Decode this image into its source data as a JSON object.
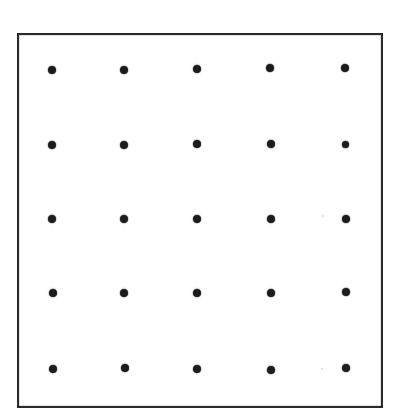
{
  "figure": {
    "canvas": {
      "width": 401,
      "height": 419,
      "background": "#ffffff"
    },
    "frame": {
      "x": 17,
      "y": 33,
      "width": 366,
      "height": 375,
      "border_width": 2,
      "border_color": "#2b2b2b",
      "fill": "#ffffff"
    },
    "marker": {
      "shape": "circle",
      "diameter": 8,
      "color": "#1c1c1c",
      "count": 25
    },
    "artifacts": [
      {
        "name": "faint-speck",
        "x": 323,
        "y": 216,
        "size": 2
      },
      {
        "name": "faint-speck",
        "x": 322,
        "y": 369,
        "size": 2
      }
    ]
  },
  "chart_data": {
    "type": "scatter",
    "title": "",
    "subtitle": "",
    "xlabel": "",
    "ylabel": "",
    "grid": false,
    "legend": null,
    "xlim": [
      0,
      6
    ],
    "ylim": [
      0,
      6
    ],
    "rows": 5,
    "columns": 5,
    "row_labels": [
      "1",
      "2",
      "3",
      "4",
      "5"
    ],
    "column_labels": [
      "1",
      "2",
      "3",
      "4",
      "5"
    ],
    "marker_color": "#1c1c1c",
    "marker_size": 8,
    "x": [
      1,
      2,
      3,
      4,
      5,
      1,
      2,
      3,
      4,
      5,
      1,
      2,
      3,
      4,
      5,
      1,
      2,
      3,
      4,
      5,
      1,
      2,
      3,
      4,
      5
    ],
    "y": [
      5,
      5,
      5,
      5,
      5,
      4,
      4,
      4,
      4,
      4,
      3,
      3,
      3,
      3,
      3,
      2,
      2,
      2,
      2,
      2,
      1,
      1,
      1,
      1,
      1
    ],
    "points": [
      {
        "row": 1,
        "col": 1,
        "px": 52,
        "py": 70,
        "d": 8
      },
      {
        "row": 1,
        "col": 2,
        "px": 124,
        "py": 70,
        "d": 8
      },
      {
        "row": 1,
        "col": 3,
        "px": 197,
        "py": 69,
        "d": 8
      },
      {
        "row": 1,
        "col": 4,
        "px": 270,
        "py": 68,
        "d": 8
      },
      {
        "row": 1,
        "col": 5,
        "px": 345,
        "py": 68,
        "d": 8
      },
      {
        "row": 2,
        "col": 1,
        "px": 52,
        "py": 145,
        "d": 8
      },
      {
        "row": 2,
        "col": 2,
        "px": 124,
        "py": 145,
        "d": 8
      },
      {
        "row": 2,
        "col": 3,
        "px": 197,
        "py": 144,
        "d": 8
      },
      {
        "row": 2,
        "col": 4,
        "px": 271,
        "py": 144,
        "d": 8
      },
      {
        "row": 2,
        "col": 5,
        "px": 345,
        "py": 144,
        "d": 7
      },
      {
        "row": 3,
        "col": 1,
        "px": 52,
        "py": 219,
        "d": 8
      },
      {
        "row": 3,
        "col": 2,
        "px": 124,
        "py": 219,
        "d": 8
      },
      {
        "row": 3,
        "col": 3,
        "px": 197,
        "py": 219,
        "d": 8
      },
      {
        "row": 3,
        "col": 4,
        "px": 271,
        "py": 219,
        "d": 8
      },
      {
        "row": 3,
        "col": 5,
        "px": 346,
        "py": 219,
        "d": 8
      },
      {
        "row": 4,
        "col": 1,
        "px": 53,
        "py": 293,
        "d": 8
      },
      {
        "row": 4,
        "col": 2,
        "px": 124,
        "py": 293,
        "d": 8
      },
      {
        "row": 4,
        "col": 3,
        "px": 197,
        "py": 293,
        "d": 8
      },
      {
        "row": 4,
        "col": 4,
        "px": 271,
        "py": 293,
        "d": 8
      },
      {
        "row": 4,
        "col": 5,
        "px": 346,
        "py": 292,
        "d": 8
      },
      {
        "row": 5,
        "col": 1,
        "px": 53,
        "py": 369,
        "d": 8
      },
      {
        "row": 5,
        "col": 2,
        "px": 125,
        "py": 368,
        "d": 8
      },
      {
        "row": 5,
        "col": 3,
        "px": 197,
        "py": 369,
        "d": 8
      },
      {
        "row": 5,
        "col": 4,
        "px": 271,
        "py": 370,
        "d": 8
      },
      {
        "row": 5,
        "col": 5,
        "px": 346,
        "py": 368,
        "d": 8
      }
    ]
  }
}
